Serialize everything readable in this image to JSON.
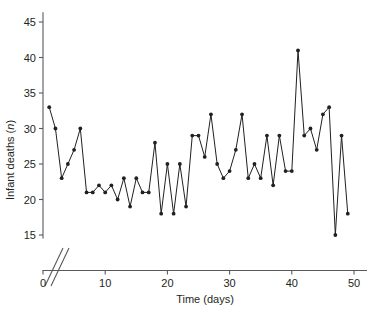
{
  "chart_data": {
    "type": "line",
    "title": "",
    "subtitle": "",
    "xlabel": "Time (days)",
    "ylabel": "Infant deaths (n)",
    "ylabel_prefix": "Infant deaths (",
    "ylabel_italic": "n",
    "ylabel_suffix": ")",
    "grid": false,
    "legend": null,
    "markers": "filled-circle",
    "line_color": "#231f20",
    "marker_color": "#231f20",
    "axis_color": "#58595b",
    "axis_break": "double-slash at y-axis base",
    "xlim": [
      0,
      52
    ],
    "ylim": [
      14,
      46.5
    ],
    "xticks": [
      0,
      10,
      20,
      30,
      40,
      50
    ],
    "xtick_labels": [
      "0",
      "10",
      "20",
      "30",
      "40",
      "50"
    ],
    "yticks": [
      15,
      20,
      25,
      30,
      35,
      40,
      45
    ],
    "ytick_labels": [
      "15",
      "20",
      "25",
      "30",
      "35",
      "40",
      "45"
    ],
    "x": [
      1,
      2,
      3,
      4,
      5,
      6,
      7,
      8,
      9,
      10,
      11,
      12,
      13,
      14,
      15,
      16,
      17,
      18,
      19,
      20,
      21,
      22,
      23,
      24,
      25,
      26,
      27,
      28,
      29,
      30,
      31,
      32,
      33,
      34,
      35,
      36,
      37,
      38,
      39,
      40,
      41,
      42,
      43,
      44,
      45,
      46,
      47,
      48,
      49
    ],
    "values": [
      33,
      30,
      23,
      25,
      27,
      30,
      21,
      21,
      22,
      21,
      22,
      20,
      23,
      19,
      23,
      21,
      21,
      28,
      18,
      25,
      18,
      25,
      19,
      29,
      29,
      26,
      32,
      25,
      23,
      24,
      27,
      32,
      23,
      25,
      23,
      29,
      22,
      29,
      24,
      24,
      41,
      29,
      30,
      27,
      32,
      33,
      15,
      29,
      18
    ],
    "series": [
      {
        "name": "Infant deaths",
        "values": [
          33,
          30,
          23,
          25,
          27,
          30,
          21,
          21,
          22,
          21,
          22,
          20,
          23,
          19,
          23,
          21,
          21,
          28,
          18,
          25,
          18,
          25,
          19,
          29,
          29,
          26,
          32,
          25,
          23,
          24,
          27,
          32,
          23,
          25,
          23,
          29,
          22,
          29,
          24,
          24,
          41,
          29,
          30,
          27,
          32,
          33,
          15,
          29,
          18
        ]
      }
    ]
  }
}
